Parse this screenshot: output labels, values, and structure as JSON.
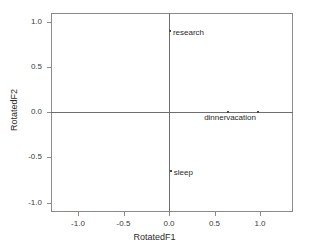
{
  "chart_data": {
    "type": "scatter",
    "title": "",
    "xlabel": "RotatedF1",
    "ylabel": "RotatedF2",
    "xlim": [
      -1.15,
      1.15
    ],
    "ylim": [
      -1.15,
      1.15
    ],
    "grid": false,
    "legend": "none",
    "xticks": [
      "-1.0",
      "-0.5",
      "0.0",
      "0.5",
      "1.0"
    ],
    "xtick_values": [
      -1.0,
      -0.5,
      0.0,
      0.5,
      1.0
    ],
    "yticks": [
      "1.0",
      "0.5",
      "0.0",
      "-0.5",
      "-1.0"
    ],
    "ytick_values": [
      1.0,
      0.5,
      0.0,
      -0.5,
      -1.0
    ],
    "points": [
      {
        "label": "research",
        "x": 0.01,
        "y": 0.89,
        "label_side": "right"
      },
      {
        "label": "dinner",
        "x": 0.65,
        "y": 0.0,
        "label_side": "left"
      },
      {
        "label": "vacation",
        "x": 0.98,
        "y": 0.0,
        "label_side": "left"
      },
      {
        "label": "sleep",
        "x": 0.02,
        "y": -0.65,
        "label_side": "right"
      }
    ]
  },
  "colors": {
    "frame": "#8a8a8a",
    "axis": "#6e6e6e",
    "marker": "#4a4a4a",
    "text": "#2a2a2a",
    "background": "#ffffff"
  }
}
